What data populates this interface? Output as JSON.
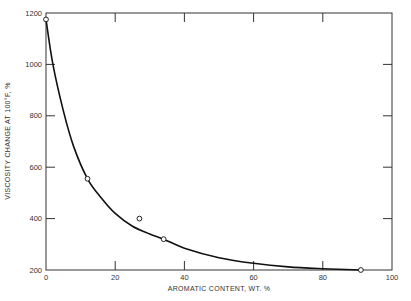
{
  "chart_data": {
    "type": "line",
    "title": "",
    "xlabel": "AROMATIC CONTENT, WT. %",
    "ylabel": "VISCOSITY CHANGE AT 100°F, %",
    "xlim": [
      0,
      100
    ],
    "ylim": [
      200,
      1200
    ],
    "x_ticks": [
      0,
      20,
      40,
      60,
      80,
      100
    ],
    "y_ticks": [
      200,
      400,
      600,
      800,
      1000,
      1200
    ],
    "x_tick_labels": [
      "0",
      "20",
      "40",
      "60",
      "80",
      "100"
    ],
    "y_tick_labels": [
      "200",
      "400",
      "600",
      "800",
      "1000",
      "1200"
    ],
    "grid": false,
    "legend": null,
    "series": [
      {
        "name": "measured",
        "style": "open-circle markers",
        "x": [
          0,
          12,
          27,
          34,
          91
        ],
        "y": [
          1175,
          555,
          400,
          320,
          200
        ]
      },
      {
        "name": "fitted curve",
        "style": "solid line",
        "x": [
          0,
          2,
          5,
          8,
          12,
          16,
          20,
          25,
          30,
          34,
          40,
          50,
          60,
          70,
          80,
          91
        ],
        "y": [
          1175,
          1000,
          820,
          680,
          555,
          480,
          420,
          370,
          340,
          320,
          285,
          248,
          226,
          212,
          205,
          200
        ]
      }
    ]
  }
}
